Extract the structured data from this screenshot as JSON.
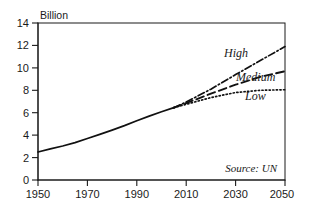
{
  "chart_data": {
    "type": "line",
    "title": "",
    "subtitle": "",
    "xlabel": "",
    "ylabel": "Billion",
    "unit_label": "Billion",
    "xlim": [
      1950,
      2050
    ],
    "ylim": [
      0,
      14
    ],
    "grid": false,
    "legend_position": "inline-right",
    "xticks": [
      1950,
      1970,
      1990,
      2010,
      2030,
      2050
    ],
    "xtick_labels": [
      "1950",
      "1970",
      "1990",
      "2010",
      "2030",
      "2050"
    ],
    "yticks": [
      0,
      2,
      4,
      6,
      8,
      10,
      12,
      14
    ],
    "ytick_labels": [
      "0",
      "2",
      "4",
      "6",
      "8",
      "10",
      "12",
      "14"
    ],
    "annotations": [
      {
        "name": "source",
        "text": "Source: UN"
      }
    ],
    "series": [
      {
        "name": "Historic",
        "label": "",
        "style": "solid",
        "x": [
          1950,
          1955,
          1960,
          1965,
          1970,
          1975,
          1980,
          1985,
          1990,
          1995,
          2000,
          2005
        ],
        "values": [
          2.5,
          2.77,
          3.03,
          3.33,
          3.7,
          4.07,
          4.45,
          4.85,
          5.29,
          5.7,
          6.08,
          6.45
        ]
      },
      {
        "name": "High",
        "label": "High",
        "style": "dash-dot",
        "x": [
          2005,
          2010,
          2020,
          2030,
          2040,
          2050
        ],
        "values": [
          6.45,
          6.95,
          8.1,
          9.4,
          10.65,
          11.9
        ]
      },
      {
        "name": "Medium",
        "label": "Medium",
        "style": "dashed",
        "x": [
          2005,
          2010,
          2020,
          2030,
          2040,
          2050
        ],
        "values": [
          6.45,
          6.85,
          7.7,
          8.5,
          9.2,
          9.7
        ]
      },
      {
        "name": "Low",
        "label": "Low",
        "style": "dotted",
        "x": [
          2005,
          2010,
          2020,
          2030,
          2040,
          2050
        ],
        "values": [
          6.45,
          6.75,
          7.35,
          7.8,
          8.0,
          8.05
        ]
      }
    ]
  },
  "labels": {
    "unit": "Billion",
    "high": "High",
    "medium": "Medium",
    "low": "Low",
    "source": "Source: UN",
    "y0": "0",
    "y2": "2",
    "y4": "4",
    "y6": "6",
    "y8": "8",
    "y10": "10",
    "y12": "12",
    "y14": "14",
    "x1950": "1950",
    "x1970": "1970",
    "x1990": "1990",
    "x2010": "2010",
    "x2030": "2030",
    "x2050": "2050"
  },
  "colors": {
    "ink": "#1a1a1a",
    "line": "#111111",
    "background": "#ffffff"
  }
}
